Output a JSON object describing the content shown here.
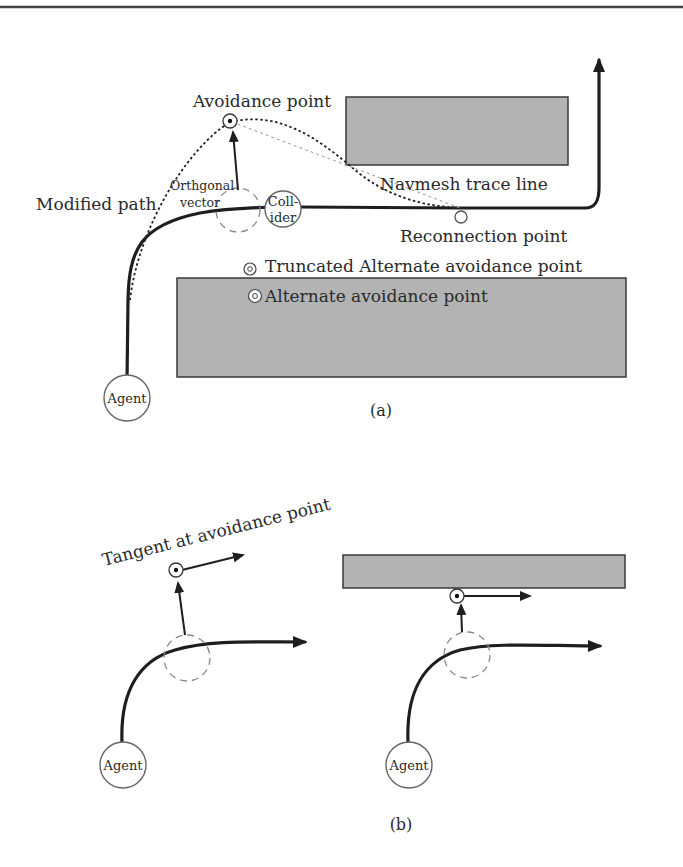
{
  "figure": {
    "top_rule": true,
    "panel_a": {
      "caption": "(a)",
      "labels": {
        "avoidance_point": "Avoidance point",
        "orthogonal_vector_line1": "Orthgonal",
        "orthogonal_vector_line2": "vector",
        "modified_path": "Modified path",
        "collider_line1": "Coll-",
        "collider_line2": "ider",
        "navmesh_trace_line": "Navmesh trace line",
        "reconnection_point": "Reconnection point",
        "truncated_alternate_avoidance_point": "Truncated Alternate avoidance point",
        "alternate_avoidance_point": "Alternate avoidance point",
        "agent": "Agent"
      },
      "obstacles": [
        {
          "name": "upper-obstacle",
          "x": 346,
          "y": 97,
          "w": 222,
          "h": 68
        },
        {
          "name": "lower-obstacle",
          "x": 177,
          "y": 278,
          "w": 449,
          "h": 99
        }
      ]
    },
    "panel_b": {
      "caption": "(b)",
      "labels": {
        "tangent_at_avoidance_point": "Tangent at avoidance point",
        "agent_left": "Agent",
        "agent_right": "Agent"
      },
      "obstacles": [
        {
          "name": "wall-obstacle",
          "x": 343,
          "y": 555,
          "w": 282,
          "h": 33
        }
      ]
    },
    "colors": {
      "obstacle_fill": "#b3b3b3",
      "obstacle_stroke": "#3a3a3a",
      "path": "#1e1e1e",
      "ghost_collider": "#8a8a8a",
      "trace_line": "#9a9a9a"
    }
  }
}
